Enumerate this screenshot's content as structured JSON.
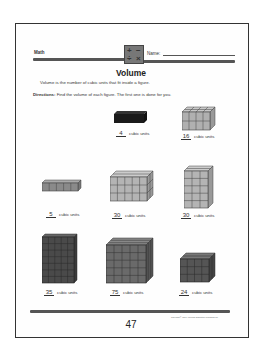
{
  "header": {
    "subject": "Math",
    "name_label": "Name:",
    "logo_symbols": [
      "+",
      "−",
      "÷",
      "×"
    ]
  },
  "title": "Volume",
  "intro": "Volume is the number of cubic units that fit inside a figure.",
  "directions": {
    "label": "Directions:",
    "text": "Find the volume of each figure. The first one is done for you."
  },
  "figures": [
    {
      "answer": "4",
      "unit": "cubic units",
      "shade": "#1a1a1a",
      "dims": "4x1x1"
    },
    {
      "answer": "16",
      "unit": "cubic units",
      "shade": "#aaaaaa",
      "dims": "4x2x2"
    },
    {
      "answer": "5",
      "unit": "cubic units",
      "shade": "#8a8a8a",
      "dims": "5x1x1"
    },
    {
      "answer": "30",
      "unit": "cubic units",
      "shade": "#b4b4b4",
      "dims": "5x3x2"
    },
    {
      "answer": "30",
      "unit": "cubic units",
      "shade": "#b4b4b4",
      "dims": "3x5x2"
    },
    {
      "answer": "35",
      "unit": "cubic units",
      "shade": "#4a4a4a",
      "dims": "5x7x1"
    },
    {
      "answer": "75",
      "unit": "cubic units",
      "shade": "#6a6a6a",
      "dims": "5x5x3"
    },
    {
      "answer": "24",
      "unit": "cubic units",
      "shade": "#555555",
      "dims": "4x3x2"
    }
  ],
  "footer": {
    "page_number": "47",
    "copyright": "Copyright © 1997 American Education Publishing Co."
  }
}
